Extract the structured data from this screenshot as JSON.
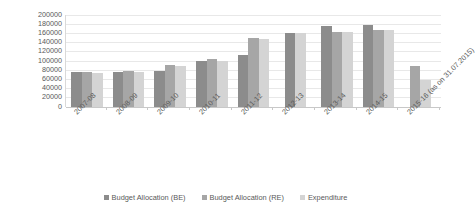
{
  "chart_data": {
    "type": "bar",
    "title": "",
    "subtitle": "",
    "xlabel": "",
    "ylabel": "INR (in million)",
    "ylim": [
      0,
      200000
    ],
    "y_ticks": [
      200000,
      180000,
      160000,
      140000,
      120000,
      100000,
      80000,
      60000,
      40000,
      20000,
      0
    ],
    "y_tick_labels": [
      "200000",
      "180000",
      "160000",
      "140000",
      "120000",
      "100000",
      "80000",
      "60000",
      "40000",
      "20000",
      "0"
    ],
    "grid": true,
    "legend_position": "bottom",
    "categories": [
      "2007-08",
      "2008-09",
      "2009-10",
      "2010-11",
      "2011-12",
      "2012-13",
      "2013-14",
      "2014-15",
      "2015-16 (as on 31.07.2015)"
    ],
    "series": [
      {
        "name": "Budget Allocation (BE)",
        "color": "#8c8c8c",
        "values": [
          74000,
          76000,
          77000,
          100000,
          112000,
          160000,
          175000,
          178000,
          0
        ]
      },
      {
        "name": "Budget Allocation (RE)",
        "color": "#a6a6a6",
        "values": [
          74000,
          77000,
          90000,
          103000,
          148000,
          0,
          163000,
          167000,
          88000
        ]
      },
      {
        "name": "Expenditure",
        "color": "#d4d4d4",
        "values": [
          72000,
          76000,
          88000,
          100000,
          146000,
          160000,
          163000,
          166000,
          57000
        ]
      }
    ]
  },
  "legend": {
    "items": [
      {
        "label": "Budget Allocation (BE)",
        "color": "#8c8c8c"
      },
      {
        "label": "Budget Allocation (RE)",
        "color": "#a6a6a6"
      },
      {
        "label": "Expenditure",
        "color": "#d4d4d4"
      }
    ]
  },
  "colors": {
    "be": "#8c8c8c",
    "re": "#a6a6a6",
    "expenditure": "#d4d4d4",
    "gridline": "#e8e8e8",
    "axis": "#c8c8c8",
    "text": "#595959",
    "background": "#ffffff"
  }
}
